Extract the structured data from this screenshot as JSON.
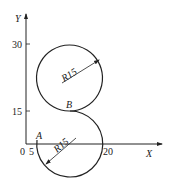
{
  "diagram": {
    "axes": {
      "x_label": "X",
      "y_label": "Y",
      "origin_label": "0",
      "x_ticks": [
        {
          "value": "5",
          "label": "5"
        },
        {
          "value": "20",
          "label": "20"
        }
      ],
      "y_ticks": [
        {
          "value": "15",
          "label": "15"
        },
        {
          "value": "30",
          "label": "30"
        }
      ]
    },
    "points": {
      "A": "A",
      "B": "B"
    },
    "upper_circle": {
      "radius_label": "R15"
    },
    "lower_circle": {
      "radius_label": "R15"
    },
    "colors": {
      "line": "#222222",
      "background": "#ffffff"
    }
  }
}
